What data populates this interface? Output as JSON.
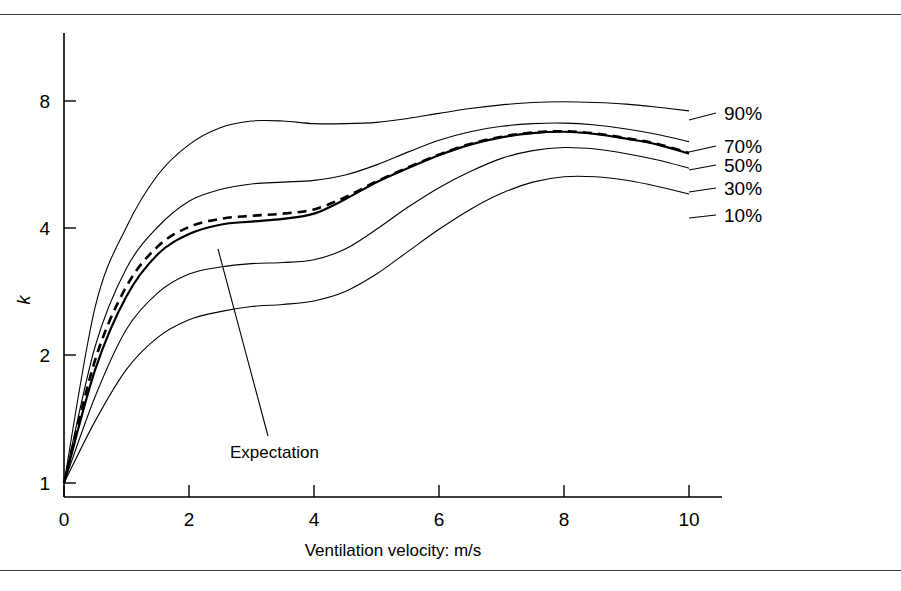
{
  "figure": {
    "background": "#ffffff",
    "line_color": "#000000",
    "rule_color": "#3a3a3a"
  },
  "chart_data": {
    "type": "line",
    "title": "",
    "xlabel": "Ventilation velocity: m/s",
    "ylabel": "k",
    "xlim": [
      0,
      10.6
    ],
    "ylim": [
      1,
      9.6
    ],
    "yscale": "log2",
    "grid": false,
    "legend_position": "right-inline-labels",
    "xticks": [
      0,
      2,
      4,
      6,
      8,
      10
    ],
    "xtick_labels": [
      "0",
      "2",
      "4",
      "6",
      "8",
      "10"
    ],
    "yticks": [
      1,
      2,
      4,
      8
    ],
    "ytick_labels": [
      "1",
      "2",
      "4",
      "8"
    ],
    "x": [
      0,
      0.5,
      1,
      1.5,
      2,
      2.5,
      3,
      3.5,
      4,
      4.5,
      5,
      5.5,
      6,
      6.5,
      7,
      7.5,
      8,
      8.5,
      9,
      9.5,
      10
    ],
    "series": [
      {
        "name": "90%",
        "label": "90%",
        "style": "solid",
        "values": [
          1.0,
          2.6,
          4.0,
          5.3,
          6.25,
          6.85,
          7.1,
          7.1,
          7.0,
          7.0,
          7.05,
          7.2,
          7.4,
          7.6,
          7.75,
          7.85,
          7.88,
          7.85,
          7.78,
          7.65,
          7.5
        ]
      },
      {
        "name": "70%",
        "label": "70%",
        "style": "solid",
        "values": [
          1.0,
          2.1,
          3.2,
          4.0,
          4.6,
          4.9,
          5.05,
          5.1,
          5.15,
          5.3,
          5.6,
          6.0,
          6.4,
          6.7,
          6.9,
          7.0,
          7.02,
          6.95,
          6.8,
          6.6,
          6.35
        ]
      },
      {
        "name": "50%",
        "label": "50%",
        "style": "solid",
        "values": [
          1.0,
          1.85,
          2.75,
          3.45,
          3.85,
          4.05,
          4.12,
          4.18,
          4.3,
          4.65,
          5.1,
          5.5,
          5.9,
          6.25,
          6.5,
          6.65,
          6.7,
          6.62,
          6.45,
          6.25,
          5.95
        ]
      },
      {
        "name": "30%",
        "label": "30%",
        "style": "solid",
        "values": [
          1.0,
          1.6,
          2.3,
          2.8,
          3.1,
          3.22,
          3.28,
          3.3,
          3.35,
          3.55,
          3.95,
          4.45,
          4.95,
          5.4,
          5.8,
          6.05,
          6.15,
          6.1,
          5.95,
          5.75,
          5.5
        ]
      },
      {
        "name": "10%",
        "label": "10%",
        "style": "solid",
        "values": [
          1.0,
          1.4,
          1.85,
          2.2,
          2.42,
          2.53,
          2.6,
          2.63,
          2.68,
          2.82,
          3.1,
          3.5,
          3.95,
          4.4,
          4.8,
          5.1,
          5.25,
          5.25,
          5.15,
          4.98,
          4.78
        ]
      },
      {
        "name": "Expectation",
        "label": "Expectation",
        "style": "dashed",
        "values": [
          1.0,
          1.95,
          2.9,
          3.6,
          4.0,
          4.18,
          4.25,
          4.3,
          4.4,
          4.7,
          5.12,
          5.52,
          5.92,
          6.27,
          6.52,
          6.67,
          6.72,
          6.64,
          6.47,
          6.27,
          5.97
        ]
      }
    ],
    "annotations": [
      {
        "text": "Expectation",
        "target_x": 2.47,
        "target_y": 4.25
      }
    ]
  }
}
